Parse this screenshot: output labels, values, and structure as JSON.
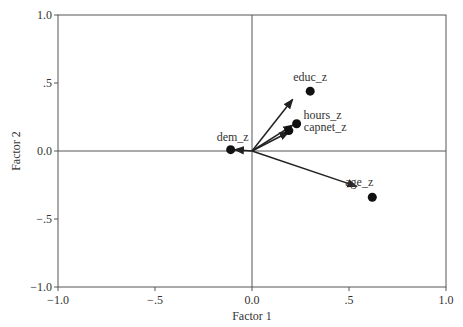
{
  "chart_data": {
    "type": "scatter",
    "title": "",
    "xlabel": "Factor 1",
    "ylabel": "Factor 2",
    "xlim": [
      -1.0,
      1.0
    ],
    "ylim": [
      -1.0,
      1.0
    ],
    "x_ticks": [
      "-1.0",
      "-.5",
      "0.0",
      ".5",
      "1.0"
    ],
    "y_ticks": [
      "1.0",
      ".5",
      "0.0",
      "-.5",
      "-1.0"
    ],
    "grid": false,
    "reference_lines": {
      "x": 0,
      "y": 0
    },
    "points": [
      {
        "label": "educ_z",
        "x": 0.3,
        "y": 0.44,
        "arrow_to": [
          0.21,
          0.38
        ]
      },
      {
        "label": "hours_z",
        "x": 0.23,
        "y": 0.2,
        "arrow_to": [
          0.21,
          0.19
        ]
      },
      {
        "label": "capnet_z",
        "x": 0.19,
        "y": 0.15,
        "arrow_to": [
          0.19,
          0.14
        ]
      },
      {
        "label": "dem_z",
        "x": -0.11,
        "y": 0.01,
        "arrow_to": [
          -0.09,
          0.01
        ]
      },
      {
        "label": "age_z",
        "x": 0.62,
        "y": -0.34,
        "arrow_to": [
          0.54,
          -0.26
        ]
      }
    ]
  }
}
